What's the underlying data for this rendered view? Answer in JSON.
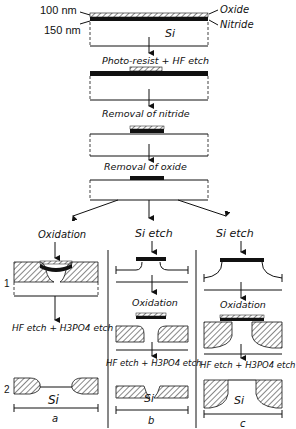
{
  "top": {
    "dim_100": "100 nm",
    "dim_150": "150 nm",
    "oxide": "Oxide",
    "nitride": "Nitride",
    "si": "Si"
  },
  "steps": {
    "s1": "Photo-resist + HF etch",
    "s2": "Removal of nitride",
    "s3": "Removal of oxide"
  },
  "columns": {
    "a": {
      "step1": "Oxidation",
      "step2": "HF etch + H3PO4 etch",
      "label": "a",
      "si": "Si"
    },
    "b": {
      "step0": "Si etch",
      "step1": "Oxidation",
      "step2": "HF etch + H3PO4 etch",
      "label": "b",
      "si": "Si"
    },
    "c": {
      "step0": "Si etch",
      "step1": "Oxidation",
      "step2": "HF etch + H3PO4 etch",
      "label": "c",
      "si": "Si"
    }
  },
  "rows": {
    "r1": "1",
    "r2": "2"
  }
}
